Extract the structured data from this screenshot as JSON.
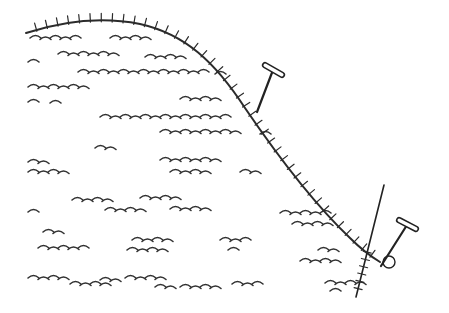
{
  "figure": {
    "colors": {
      "background": "#ffffff",
      "ink": "#2b2b2b"
    },
    "slope": {
      "path": "M26,33 C60,22 100,16 140,24 C185,34 215,62 245,108 C275,152 310,200 350,238 C360,248 370,256 380,262",
      "hatch_count": 42,
      "hatch_length": 7
    },
    "stakes": [
      {
        "name": "upper-stake",
        "shaft": [
          257,
          112,
          273,
          70
        ],
        "handle": [
          263,
          64,
          284,
          76
        ]
      },
      {
        "name": "lower-stake",
        "shaft": [
          381,
          266,
          407,
          225
        ],
        "handle": [
          397,
          219,
          418,
          230
        ]
      }
    ],
    "pole": {
      "from": [
        384,
        185
      ],
      "to": [
        356,
        297
      ],
      "hatch_count": 6
    },
    "loop": {
      "cx": 389,
      "cy": 262,
      "r": 6
    },
    "turf_rows": [
      {
        "y": 36,
        "x1": 30,
        "x2": 86
      },
      {
        "y": 36,
        "x1": 110,
        "x2": 150
      },
      {
        "y": 52,
        "x1": 58,
        "x2": 125
      },
      {
        "y": 55,
        "x1": 145,
        "x2": 190
      },
      {
        "y": 60,
        "x1": 28,
        "x2": 40
      },
      {
        "y": 70,
        "x1": 78,
        "x2": 210
      },
      {
        "y": 72,
        "x1": 215,
        "x2": 232
      },
      {
        "y": 85,
        "x1": 28,
        "x2": 88
      },
      {
        "y": 100,
        "x1": 28,
        "x2": 40
      },
      {
        "y": 101,
        "x1": 50,
        "x2": 60
      },
      {
        "y": 97,
        "x1": 180,
        "x2": 222
      },
      {
        "y": 115,
        "x1": 100,
        "x2": 230
      },
      {
        "y": 130,
        "x1": 160,
        "x2": 240
      },
      {
        "y": 132,
        "x1": 260,
        "x2": 278
      },
      {
        "y": 146,
        "x1": 95,
        "x2": 120
      },
      {
        "y": 160,
        "x1": 28,
        "x2": 48
      },
      {
        "y": 158,
        "x1": 160,
        "x2": 220
      },
      {
        "y": 170,
        "x1": 28,
        "x2": 75
      },
      {
        "y": 170,
        "x1": 170,
        "x2": 210
      },
      {
        "y": 170,
        "x1": 240,
        "x2": 265
      },
      {
        "y": 198,
        "x1": 72,
        "x2": 118
      },
      {
        "y": 196,
        "x1": 140,
        "x2": 185
      },
      {
        "y": 208,
        "x1": 105,
        "x2": 150
      },
      {
        "y": 207,
        "x1": 170,
        "x2": 218
      },
      {
        "y": 210,
        "x1": 28,
        "x2": 40
      },
      {
        "y": 211,
        "x1": 280,
        "x2": 330
      },
      {
        "y": 222,
        "x1": 292,
        "x2": 338
      },
      {
        "y": 230,
        "x1": 43,
        "x2": 70
      },
      {
        "y": 238,
        "x1": 132,
        "x2": 172
      },
      {
        "y": 238,
        "x1": 220,
        "x2": 250
      },
      {
        "y": 246,
        "x1": 38,
        "x2": 96
      },
      {
        "y": 248,
        "x1": 127,
        "x2": 168
      },
      {
        "y": 248,
        "x1": 228,
        "x2": 245
      },
      {
        "y": 248,
        "x1": 318,
        "x2": 343
      },
      {
        "y": 259,
        "x1": 300,
        "x2": 343
      },
      {
        "y": 276,
        "x1": 28,
        "x2": 75
      },
      {
        "y": 278,
        "x1": 100,
        "x2": 120
      },
      {
        "y": 276,
        "x1": 125,
        "x2": 170
      },
      {
        "y": 282,
        "x1": 70,
        "x2": 115
      },
      {
        "y": 285,
        "x1": 155,
        "x2": 180
      },
      {
        "y": 285,
        "x1": 180,
        "x2": 225
      },
      {
        "y": 282,
        "x1": 232,
        "x2": 265
      },
      {
        "y": 281,
        "x1": 325,
        "x2": 365
      },
      {
        "y": 289,
        "x1": 330,
        "x2": 345
      }
    ]
  }
}
